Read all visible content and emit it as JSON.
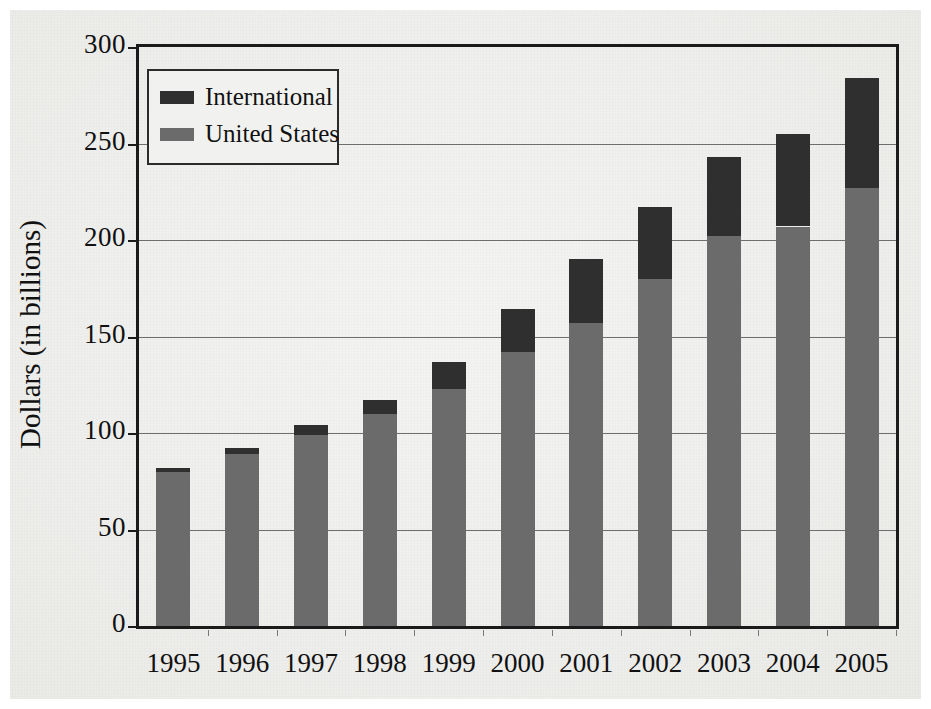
{
  "chart_data": {
    "type": "bar",
    "subtype": "stacked-vertical",
    "title": "",
    "xlabel": "",
    "ylabel": "Dollars (in billions)",
    "ylim": [
      0,
      300
    ],
    "yticks": [
      0,
      50,
      100,
      150,
      200,
      250,
      300
    ],
    "ytick_labels": [
      "0",
      "50",
      "100",
      "150",
      "200",
      "250",
      "300"
    ],
    "grid": "horizontal",
    "legend_position": "top-left-inside",
    "categories": [
      "1995",
      "1996",
      "1997",
      "1998",
      "1999",
      "2000",
      "2001",
      "2002",
      "2003",
      "2004",
      "2005"
    ],
    "series": [
      {
        "name": "United States",
        "color": "#6b6b6b",
        "values": [
          80,
          89,
          99,
          110,
          123,
          142,
          157,
          180,
          202,
          207,
          227
        ]
      },
      {
        "name": "International",
        "color": "#2f2f2f",
        "values": [
          2,
          3,
          5,
          7,
          14,
          22,
          33,
          37,
          41,
          48,
          57
        ]
      }
    ],
    "totals": [
      82,
      92,
      104,
      117,
      137,
      164,
      190,
      217,
      243,
      255,
      284
    ],
    "stack_order": [
      "United States",
      "International"
    ]
  },
  "legend": {
    "entries": [
      {
        "label": "International",
        "color": "#2f2f2f"
      },
      {
        "label": "United States",
        "color": "#6b6b6b"
      }
    ]
  },
  "axes": {
    "y_title": "Dollars (in billions)"
  }
}
